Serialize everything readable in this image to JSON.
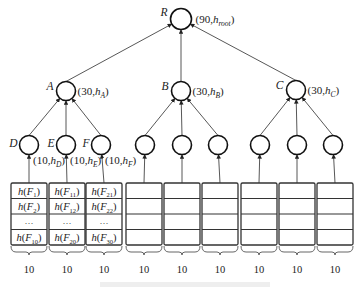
{
  "figure": {
    "root": {
      "id": "R",
      "label": "R",
      "annotation": "(90,h",
      "annotation_sub": "root",
      "annotation_end": ")",
      "cx": 181,
      "cy": 19
    },
    "groups": [
      {
        "id": "A",
        "label": "A",
        "annotation": "(30,h",
        "annotation_sub": "A",
        "annotation_end": ")",
        "cx": 66,
        "cy": 91,
        "leaves": [
          {
            "label": "D",
            "annotation": "(10,h",
            "annotation_sub": "D",
            "annotation_end": ")",
            "cx": 29,
            "cy": 145,
            "box_x": 11,
            "rows": [
              {
                "h": "h(F",
                "sub": "1",
                "end": ")"
              },
              {
                "h": "h(F",
                "sub": "2",
                "end": ")"
              },
              {
                "h": "···",
                "sub": "",
                "end": ""
              },
              {
                "h": "h(F",
                "sub": "10",
                "end": ")"
              }
            ],
            "count": "10"
          },
          {
            "label": "E",
            "annotation": "(10,h",
            "annotation_sub": "E",
            "annotation_end": ")",
            "cx": 66,
            "cy": 145,
            "box_x": 49,
            "rows": [
              {
                "h": "h(F",
                "sub": "11",
                "end": ")"
              },
              {
                "h": "h(F",
                "sub": "12",
                "end": ")"
              },
              {
                "h": "···",
                "sub": "",
                "end": ""
              },
              {
                "h": "h(F",
                "sub": "20",
                "end": ")"
              }
            ],
            "count": "10"
          },
          {
            "label": "F",
            "annotation": "(10,h",
            "annotation_sub": "F",
            "annotation_end": ")",
            "cx": 101,
            "cy": 145,
            "box_x": 86,
            "rows": [
              {
                "h": "h(F",
                "sub": "21",
                "end": ")"
              },
              {
                "h": "h(F",
                "sub": "22",
                "end": ")"
              },
              {
                "h": "···",
                "sub": "",
                "end": ""
              },
              {
                "h": "h(F",
                "sub": "30",
                "end": ")"
              }
            ],
            "count": "10"
          }
        ]
      },
      {
        "id": "B",
        "label": "B",
        "annotation": "(30,h",
        "annotation_sub": "B",
        "annotation_end": ")",
        "cx": 181,
        "cy": 91,
        "leaves": [
          {
            "cx": 145,
            "cy": 145,
            "box_x": 126,
            "count": "10"
          },
          {
            "cx": 182,
            "cy": 145,
            "box_x": 164,
            "count": "10"
          },
          {
            "cx": 218,
            "cy": 145,
            "box_x": 202,
            "count": "10"
          }
        ]
      },
      {
        "id": "C",
        "label": "C",
        "annotation": "(30,h",
        "annotation_sub": "C",
        "annotation_end": ")",
        "cx": 296,
        "cy": 90,
        "leaves": [
          {
            "cx": 260,
            "cy": 145,
            "box_x": 241,
            "count": "10"
          },
          {
            "cx": 297,
            "cy": 145,
            "box_x": 279,
            "count": "10"
          },
          {
            "cx": 333,
            "cy": 145,
            "box_x": 317,
            "count": "10"
          }
        ]
      }
    ],
    "box": {
      "top": 183,
      "row_height": 15.5,
      "rows": 4,
      "width": 36
    },
    "colors": {
      "stroke": "#222222",
      "background": "#ffffff"
    }
  }
}
